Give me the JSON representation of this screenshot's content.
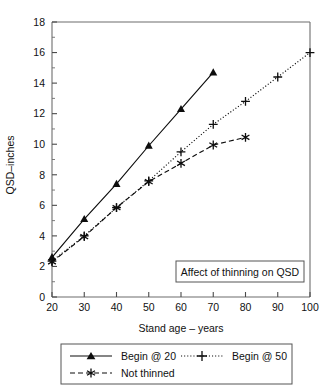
{
  "chart_data": {
    "type": "line",
    "title": "",
    "annotation": "Affect of thinning on QSD",
    "xlabel": "Stand age – years",
    "ylabel": "QSD–inches",
    "xlim": [
      20,
      100
    ],
    "ylim": [
      0,
      18
    ],
    "xticks": [
      20,
      30,
      40,
      50,
      60,
      70,
      80,
      90,
      100
    ],
    "xtick_labels": [
      "20",
      "30",
      "40",
      "50",
      "60",
      "70",
      "80",
      "90",
      "100"
    ],
    "yticks": [
      0,
      2,
      4,
      6,
      8,
      10,
      12,
      14,
      16,
      18
    ],
    "ytick_labels": [
      "0",
      "2",
      "4",
      "6",
      "8",
      "10",
      "12",
      "14",
      "16",
      "18"
    ],
    "yticks_minor": [
      1,
      3,
      5,
      7,
      9,
      11,
      13,
      15,
      17
    ],
    "grid": false,
    "legend_position": "below-axes",
    "series": [
      {
        "name": "Begin @ 20",
        "marker": "triangle-filled",
        "linestyle": "solid",
        "color": "#0d0d0d",
        "x": [
          20,
          30,
          40,
          50,
          60,
          70
        ],
        "values": [
          2.6,
          5.1,
          7.4,
          9.9,
          12.3,
          14.7
        ]
      },
      {
        "name": "Begin @ 50",
        "marker": "plus",
        "linestyle": "dotted",
        "color": "#0d0d0d",
        "x": [
          20,
          30,
          40,
          50,
          60,
          70,
          80,
          90,
          100
        ],
        "values": [
          2.35,
          4.0,
          5.85,
          7.6,
          9.5,
          11.3,
          12.8,
          14.4,
          16.0
        ]
      },
      {
        "name": "Not thinned",
        "marker": "asterisk",
        "linestyle": "dashed",
        "color": "#0d0d0d",
        "x": [
          20,
          30,
          40,
          50,
          60,
          70,
          80
        ],
        "values": [
          2.3,
          3.95,
          5.85,
          7.55,
          8.75,
          9.95,
          10.45
        ]
      }
    ]
  },
  "legend": {
    "entries": [
      {
        "label": "Begin @ 20"
      },
      {
        "label": "Begin @ 50"
      },
      {
        "label": "Not thinned"
      }
    ]
  },
  "annotation_box": {
    "text": "Affect of thinning on QSD"
  }
}
